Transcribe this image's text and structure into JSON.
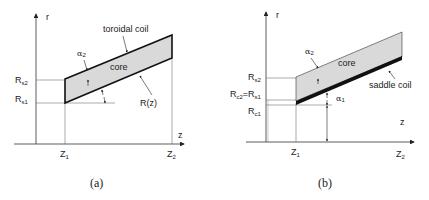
{
  "panels": [
    {
      "caption": "(a)",
      "axis_r": "r",
      "axis_z": "z",
      "z1": {
        "main": "Z",
        "sub": "1"
      },
      "z2": {
        "main": "Z",
        "sub": "2"
      },
      "rs2": {
        "main": "R",
        "sub": "s2"
      },
      "rs1": {
        "main": "R",
        "sub": "s1"
      },
      "coil_label": "toroidal coil",
      "core_label": "core",
      "rz_label": "R(z)",
      "alpha2": {
        "main": "α",
        "sub": "2"
      }
    },
    {
      "caption": "(b)",
      "axis_r": "r",
      "axis_z": "z",
      "z1": {
        "main": "Z",
        "sub": "1"
      },
      "z2": {
        "main": "Z",
        "sub": "2"
      },
      "rs2": {
        "main": "R",
        "sub": "s2"
      },
      "rc2_eq_rs1": {
        "main1": "R",
        "sub1": "c2",
        "eq": "=",
        "main2": "R",
        "sub2": "s1"
      },
      "rc1": {
        "main": "R",
        "sub": "c1"
      },
      "coil_label": "saddle coil",
      "core_label": "core",
      "alpha2": {
        "main": "α",
        "sub": "2"
      },
      "alpha1": {
        "main": "α",
        "sub": "1"
      }
    }
  ],
  "colors": {
    "core_fill": "#d9d9d9",
    "line": "#333333",
    "coil": "#111111"
  }
}
